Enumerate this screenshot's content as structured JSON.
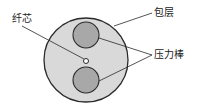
{
  "diagram": {
    "type": "fiber-cross-section",
    "labels": {
      "core": "纤芯",
      "cladding": "包层",
      "stress_rods": "压力棒"
    },
    "colors": {
      "cladding_fill": "#d9d9d9",
      "rod_fill": "#a8a8a8",
      "core_fill": "#ffffff",
      "stroke": "#2a2a2a"
    }
  }
}
